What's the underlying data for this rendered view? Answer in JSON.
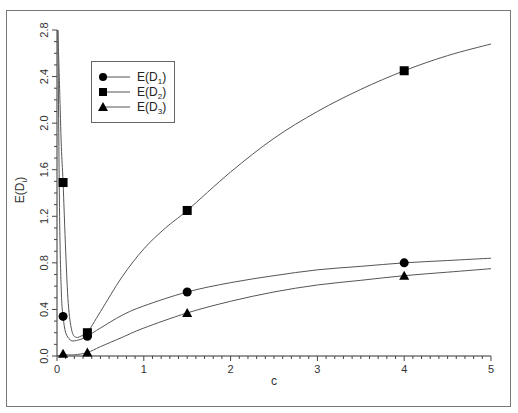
{
  "chart_data": {
    "type": "line",
    "title": "",
    "xlabel": "c",
    "ylabel": "E(D_i)",
    "xlim": [
      0,
      5
    ],
    "ylim": [
      0,
      2.8
    ],
    "xticks": [
      "0",
      "1",
      "2",
      "3",
      "4",
      "5"
    ],
    "yticks": [
      "0.0",
      "0.4",
      "0.8",
      "1.2",
      "1.6",
      "2.0",
      "2.4",
      "2.8"
    ],
    "grid": false,
    "legend_position": "upper-left",
    "marker_x": [
      0.07,
      0.35,
      1.5,
      4.0
    ],
    "series": [
      {
        "name": "E(D1)",
        "marker": "circle",
        "values": [
          0.34,
          0.17,
          0.55,
          0.8
        ],
        "curve": [
          [
            0.01,
            2.8
          ],
          [
            0.03,
            1.2
          ],
          [
            0.05,
            0.55
          ],
          [
            0.07,
            0.34
          ],
          [
            0.1,
            0.2
          ],
          [
            0.15,
            0.14
          ],
          [
            0.2,
            0.13
          ],
          [
            0.3,
            0.15
          ],
          [
            0.35,
            0.17
          ],
          [
            0.5,
            0.24
          ],
          [
            0.75,
            0.35
          ],
          [
            1.0,
            0.43
          ],
          [
            1.5,
            0.55
          ],
          [
            2.0,
            0.63
          ],
          [
            2.5,
            0.69
          ],
          [
            3.0,
            0.74
          ],
          [
            3.5,
            0.77
          ],
          [
            4.0,
            0.8
          ],
          [
            4.5,
            0.82
          ],
          [
            5.0,
            0.84
          ]
        ]
      },
      {
        "name": "E(D2)",
        "marker": "square",
        "values": [
          1.49,
          0.2,
          1.25,
          2.45
        ],
        "curve": [
          [
            0.01,
            2.8
          ],
          [
            0.03,
            2.3
          ],
          [
            0.05,
            1.8
          ],
          [
            0.07,
            1.49
          ],
          [
            0.1,
            0.9
          ],
          [
            0.13,
            0.45
          ],
          [
            0.17,
            0.22
          ],
          [
            0.22,
            0.16
          ],
          [
            0.3,
            0.18
          ],
          [
            0.35,
            0.2
          ],
          [
            0.5,
            0.38
          ],
          [
            0.75,
            0.68
          ],
          [
            1.0,
            0.92
          ],
          [
            1.25,
            1.1
          ],
          [
            1.5,
            1.25
          ],
          [
            2.0,
            1.58
          ],
          [
            2.5,
            1.87
          ],
          [
            3.0,
            2.1
          ],
          [
            3.5,
            2.29
          ],
          [
            4.0,
            2.45
          ],
          [
            4.5,
            2.58
          ],
          [
            5.0,
            2.68
          ]
        ]
      },
      {
        "name": "E(D3)",
        "marker": "triangle",
        "values": [
          0.02,
          0.03,
          0.37,
          0.69
        ],
        "curve": [
          [
            0.0,
            0.0
          ],
          [
            0.07,
            0.01
          ],
          [
            0.2,
            0.01
          ],
          [
            0.35,
            0.03
          ],
          [
            0.5,
            0.08
          ],
          [
            0.75,
            0.16
          ],
          [
            1.0,
            0.24
          ],
          [
            1.5,
            0.37
          ],
          [
            2.0,
            0.47
          ],
          [
            2.5,
            0.55
          ],
          [
            3.0,
            0.61
          ],
          [
            3.5,
            0.65
          ],
          [
            4.0,
            0.69
          ],
          [
            4.5,
            0.72
          ],
          [
            5.0,
            0.75
          ]
        ]
      }
    ]
  },
  "legend": {
    "items": [
      {
        "label": "E(D",
        "sub": "1",
        "close": ")"
      },
      {
        "label": "E(D",
        "sub": "2",
        "close": ")"
      },
      {
        "label": "E(D",
        "sub": "3",
        "close": ")"
      }
    ]
  },
  "axes": {
    "x_label": "c",
    "y_label_main": "E(D",
    "y_label_sub": "i",
    "y_label_close": ")"
  }
}
